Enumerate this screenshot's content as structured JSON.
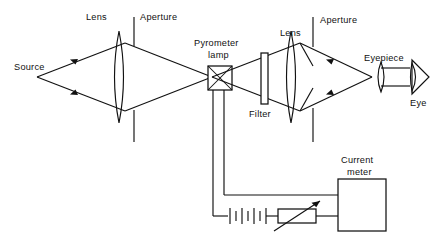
{
  "diagram": {
    "type": "optical-ray-diagram-with-circuit",
    "ink_color": "#111111",
    "background_color": "#ffffff",
    "labels": {
      "source": "Source",
      "lens_left": "Lens",
      "aperture_left": "Aperture",
      "pyrometer_lamp_line1": "Pyrometer",
      "pyrometer_lamp_line2": "lamp",
      "filter": "Filter",
      "lens_right": "Lens",
      "aperture_right": "Aperture",
      "eyepiece": "Eyepiece",
      "eye": "Eye",
      "current_meter_line1": "Current",
      "current_meter_line2": "meter"
    },
    "components": [
      {
        "name": "source",
        "kind": "point-source",
        "label": "Source"
      },
      {
        "name": "objective-lens",
        "kind": "biconvex-lens",
        "label": "Lens"
      },
      {
        "name": "objective-aperture",
        "kind": "aperture-stop",
        "label": "Aperture"
      },
      {
        "name": "pyrometer-lamp",
        "kind": "filament-lamp-box",
        "label": "Pyrometer lamp"
      },
      {
        "name": "filter",
        "kind": "optical-filter-plate",
        "label": "Filter"
      },
      {
        "name": "field-lens",
        "kind": "biconvex-lens",
        "label": "Lens"
      },
      {
        "name": "field-aperture",
        "kind": "aperture-stop",
        "label": "Aperture"
      },
      {
        "name": "eyepiece-lens",
        "kind": "biconvex-lens",
        "label": "Eyepiece"
      },
      {
        "name": "eye",
        "kind": "observer-eye",
        "label": "Eye"
      },
      {
        "name": "current-meter",
        "kind": "instrument-box",
        "label": "Current meter"
      },
      {
        "name": "battery",
        "kind": "battery-cells",
        "label": ""
      },
      {
        "name": "rheostat",
        "kind": "variable-resistor",
        "label": ""
      }
    ],
    "circuit": {
      "elements": [
        "pyrometer lamp",
        "battery",
        "rheostat",
        "current meter"
      ],
      "battery_cells": 4,
      "rheostat_variable": true
    }
  }
}
